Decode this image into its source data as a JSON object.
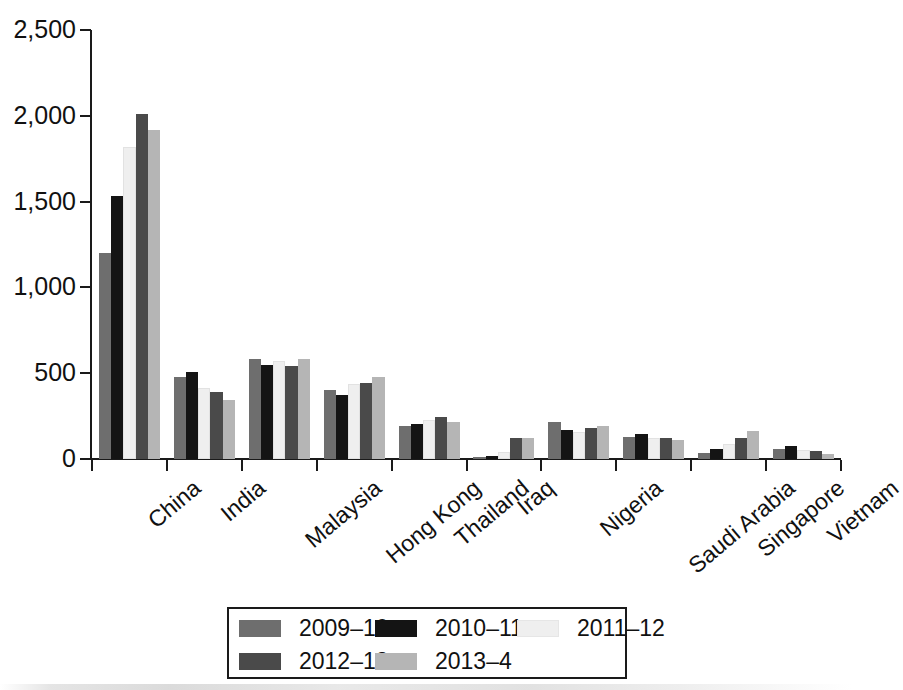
{
  "chart_data": {
    "type": "bar",
    "title": "",
    "xlabel": "",
    "ylabel": "",
    "ylim": [
      0,
      2500
    ],
    "yticks": [
      "0",
      "500",
      "1,000",
      "1,500",
      "2,000",
      "2,500"
    ],
    "ytick_values": [
      0,
      500,
      1000,
      1500,
      2000,
      2500
    ],
    "grid": false,
    "legend_position": "bottom",
    "categories": [
      "China",
      "India",
      "Malaysia",
      "Hong Kong",
      "Thailand",
      "Iraq",
      "Nigeria",
      "Saudi Arabia",
      "Singapore",
      "Vietnam"
    ],
    "series": [
      {
        "name": "2009–10",
        "color": "#6e6e6e",
        "values": [
          1200,
          480,
          580,
          400,
          195,
          10,
          215,
          130,
          35,
          60
        ]
      },
      {
        "name": "2010–11",
        "color": "#141414",
        "values": [
          1530,
          505,
          545,
          375,
          205,
          15,
          170,
          145,
          60,
          75
        ]
      },
      {
        "name": "2011–12",
        "color": "#efefef",
        "values": [
          1820,
          415,
          570,
          435,
          225,
          40,
          155,
          120,
          85,
          55
        ]
      },
      {
        "name": "2012–13",
        "color": "#4a4a4a",
        "values": [
          2010,
          390,
          540,
          445,
          245,
          120,
          180,
          120,
          125,
          45
        ]
      },
      {
        "name": "2013–4",
        "color": "#b5b5b5",
        "values": [
          1915,
          345,
          580,
          480,
          215,
          120,
          195,
          110,
          165,
          30
        ]
      }
    ]
  },
  "legend": {
    "entries": [
      {
        "label": "2009–10",
        "color": "#6e6e6e"
      },
      {
        "label": "2010–11",
        "color": "#141414"
      },
      {
        "label": "2011–12",
        "color": "#efefef"
      },
      {
        "label": "2012–13",
        "color": "#4a4a4a"
      },
      {
        "label": "2013–4",
        "color": "#b5b5b5"
      }
    ]
  },
  "axis": {
    "y_max_label": "2,500",
    "y_min_label": "0"
  }
}
